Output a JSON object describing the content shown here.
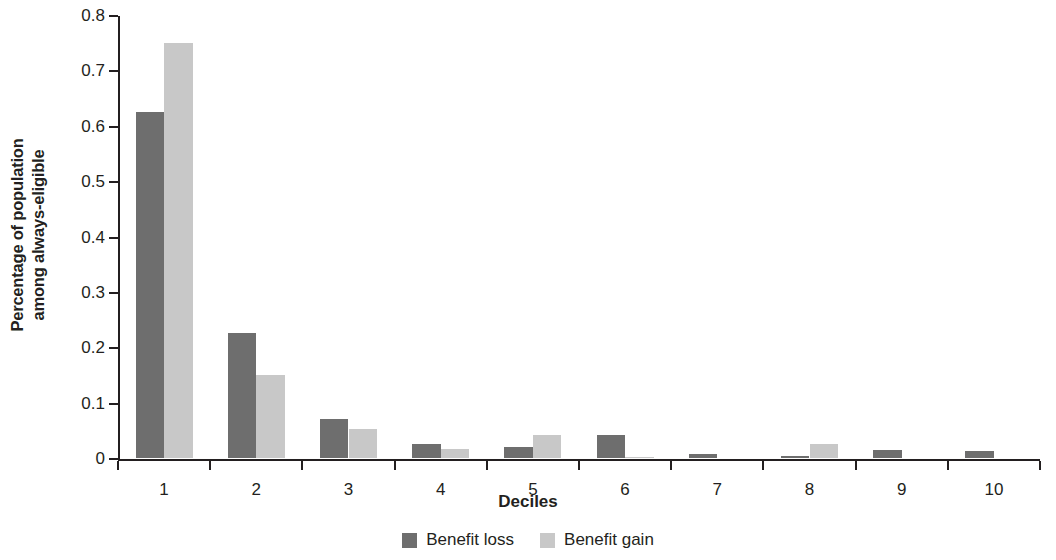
{
  "chart_data": {
    "type": "bar",
    "title": "",
    "subtitle": "",
    "xlabel": "Deciles",
    "ylabel": "Percentage of population among always-eligible",
    "ylabel_line1": "Percentage of population",
    "ylabel_line2": "among always-eligible",
    "categories": [
      "1",
      "2",
      "3",
      "4",
      "5",
      "6",
      "7",
      "8",
      "9",
      "10"
    ],
    "series": [
      {
        "name": "Benefit loss",
        "color": "#6e6e6e",
        "values": [
          0.625,
          0.225,
          0.07,
          0.026,
          0.02,
          0.042,
          0.007,
          0.003,
          0.015,
          0.012
        ]
      },
      {
        "name": "Benefit gain",
        "color": "#c8c8c8",
        "values": [
          0.75,
          0.15,
          0.053,
          0.016,
          0.042,
          0.002,
          0.0,
          0.026,
          0.0,
          0.0
        ]
      }
    ],
    "ylim": [
      0,
      0.8
    ],
    "yticks": [
      0,
      0.1,
      0.2,
      0.3,
      0.4,
      0.5,
      0.6,
      0.7,
      0.8
    ],
    "ytick_labels": [
      "0",
      "0.1",
      "0.2",
      "0.3",
      "0.4",
      "0.5",
      "0.6",
      "0.7",
      "0.8"
    ],
    "grid": false,
    "legend_position": "bottom"
  },
  "legend": {
    "items": [
      {
        "label": "Benefit loss",
        "color": "#6e6e6e"
      },
      {
        "label": "Benefit gain",
        "color": "#c8c8c8"
      }
    ]
  }
}
